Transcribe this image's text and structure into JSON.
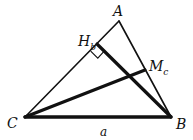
{
  "diagram": {
    "type": "geometry-triangle",
    "points": {
      "A": {
        "label": "A",
        "x": 119,
        "y": 21
      },
      "B": {
        "label": "B",
        "x": 171,
        "y": 117
      },
      "C": {
        "label": "C",
        "x": 25,
        "y": 117
      },
      "Hb": {
        "label": "H",
        "sub": "b",
        "x": 97,
        "y": 44
      },
      "Mc": {
        "label": "M",
        "sub": "c",
        "x": 145,
        "y": 70
      }
    },
    "side_labels": {
      "a": {
        "label": "a",
        "x": 100,
        "y": 134
      }
    },
    "segments": [
      {
        "name": "side-CA",
        "from": "C",
        "to": "A",
        "weight": "thin"
      },
      {
        "name": "side-AB",
        "from": "A",
        "to": "B",
        "weight": "thin"
      },
      {
        "name": "side-CB",
        "from": "C",
        "to": "B",
        "weight": "thick"
      },
      {
        "name": "altitude-BHb",
        "from": "B",
        "to": "Hb",
        "weight": "thick"
      },
      {
        "name": "median-CMc",
        "from": "C",
        "to": "Mc",
        "weight": "thick"
      }
    ],
    "right_angle_marker_at": "Hb",
    "colors": {
      "stroke": "#111111",
      "background": "#ffffff"
    }
  }
}
